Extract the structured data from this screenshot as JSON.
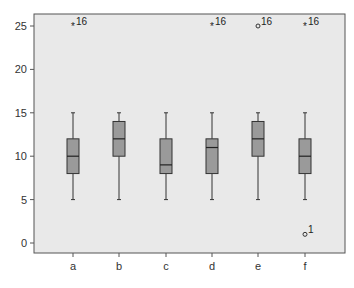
{
  "chart_data": {
    "type": "boxplot",
    "title": "",
    "xlabel": "",
    "ylabel": "",
    "categories": [
      "a",
      "b",
      "c",
      "d",
      "e",
      "f"
    ],
    "ylim": [
      -1.5,
      26.5
    ],
    "yticks": [
      0,
      5,
      10,
      15,
      20,
      25
    ],
    "grid": false,
    "boxes": [
      {
        "label": "a",
        "whisker_low": 5,
        "q1": 8,
        "median": 10,
        "q3": 12,
        "whisker_high": 15,
        "outliers": [
          {
            "value": 25,
            "marker": "star",
            "label": "16"
          }
        ]
      },
      {
        "label": "b",
        "whisker_low": 5,
        "q1": 10,
        "median": 12,
        "q3": 14,
        "whisker_high": 15,
        "outliers": []
      },
      {
        "label": "c",
        "whisker_low": 5,
        "q1": 8,
        "median": 9,
        "q3": 12,
        "whisker_high": 15,
        "outliers": []
      },
      {
        "label": "d",
        "whisker_low": 5,
        "q1": 8,
        "median": 11,
        "q3": 12,
        "whisker_high": 15,
        "outliers": [
          {
            "value": 25,
            "marker": "star",
            "label": "16"
          }
        ]
      },
      {
        "label": "e",
        "whisker_low": 5,
        "q1": 10,
        "median": 12,
        "q3": 14,
        "whisker_high": 15,
        "outliers": [
          {
            "value": 25,
            "marker": "circle",
            "label": "16"
          }
        ]
      },
      {
        "label": "f",
        "whisker_low": 5,
        "q1": 8,
        "median": 10,
        "q3": 12,
        "whisker_high": 15,
        "outliers": [
          {
            "value": 25,
            "marker": "star",
            "label": "16"
          },
          {
            "value": 1,
            "marker": "circle",
            "label": "1"
          }
        ]
      }
    ],
    "colors": {
      "plot_background": "#e9e9e9",
      "box_fill": "#9a9a9a",
      "line": "#333333",
      "frame": "#555555"
    }
  }
}
